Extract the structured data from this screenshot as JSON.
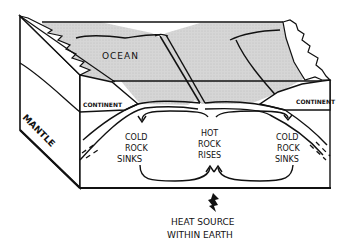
{
  "diagram": {
    "labels": {
      "ocean": "OCEAN",
      "continent_left": "CONTINENT",
      "continent_right": "CONTINENT",
      "mantle": "MANTLE",
      "cold_left": [
        "COLD",
        "ROCK",
        "SINKS"
      ],
      "hot_center": [
        "HOT",
        "ROCK",
        "RISES"
      ],
      "cold_right": [
        "COLD",
        "ROCK",
        "SINKS"
      ],
      "heat_source": [
        "HEAT SOURCE",
        "WITHIN EARTH"
      ]
    },
    "colors": {
      "ocean_fill": "#d4d4d4",
      "ink": "#111111",
      "paper": "#ffffff"
    }
  }
}
